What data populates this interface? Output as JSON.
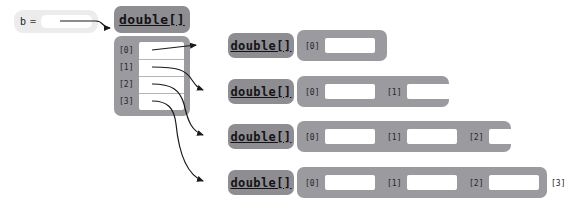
{
  "diagram": {
    "background_color": "#ffffff",
    "colors": {
      "header_gray": "#8d8d92",
      "body_gray": "#9a9a9f",
      "cell_white": "#ffffff",
      "variable_box": "#ececed",
      "line": "#1a1a1a",
      "text": "#131316"
    }
  },
  "variable": {
    "name": "b",
    "operator": "=",
    "slot_value": ""
  },
  "outer_array": {
    "type_label": "double[]",
    "indices": [
      "[0]",
      "[1]",
      "[2]",
      "[3]"
    ],
    "values": [
      "",
      "",
      "",
      ""
    ]
  },
  "inner_arrays": [
    {
      "type_label": "double[]",
      "indices": [
        "[0]"
      ],
      "values": [
        ""
      ]
    },
    {
      "type_label": "double[]",
      "indices": [
        "[0]",
        "[1]"
      ],
      "values": [
        "",
        ""
      ]
    },
    {
      "type_label": "double[]",
      "indices": [
        "[0]",
        "[1]",
        "[2]"
      ],
      "values": [
        "",
        "",
        ""
      ]
    },
    {
      "type_label": "double[]",
      "indices": [
        "[0]",
        "[1]",
        "[2]",
        "[3]"
      ],
      "values": [
        "",
        "",
        "",
        ""
      ]
    }
  ]
}
